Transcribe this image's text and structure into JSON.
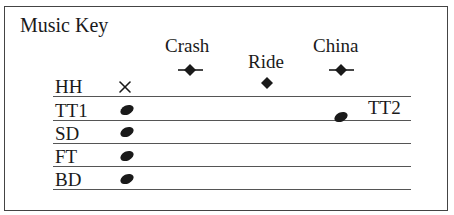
{
  "title": "Music Key",
  "cymbals": [
    {
      "label": "Crash",
      "symbol": "diamond-with-ledger"
    },
    {
      "label": "Ride",
      "symbol": "diamond"
    },
    {
      "label": "China",
      "symbol": "diamond-with-ledger"
    }
  ],
  "rows": [
    {
      "label": "HH",
      "symbol": "x-notehead"
    },
    {
      "label": "TT1",
      "symbol": "notehead"
    },
    {
      "label": "SD",
      "symbol": "notehead"
    },
    {
      "label": "FT",
      "symbol": "notehead"
    },
    {
      "label": "BD",
      "symbol": "notehead"
    }
  ],
  "extra": {
    "label": "TT2",
    "symbol": "notehead"
  },
  "colors": {
    "ink": "#1a1a1a",
    "line": "#555555",
    "frame": "#444444"
  }
}
